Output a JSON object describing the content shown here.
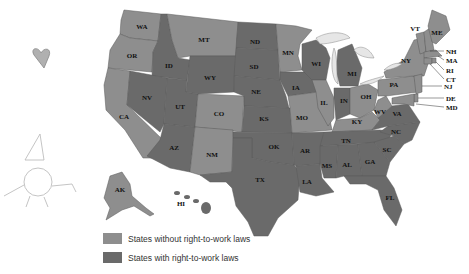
{
  "colors": {
    "without_rtw": "#8e8e8e",
    "with_rtw": "#6a6a6a",
    "lakes": "#e6e6e6"
  },
  "legend": [
    {
      "label": "States without right-to-work laws",
      "category": "without"
    },
    {
      "label": "States with right-to-work laws",
      "category": "with"
    }
  ],
  "states": {
    "WA": "WA",
    "OR": "OR",
    "CA": "CA",
    "ID": "ID",
    "NV": "NV",
    "UT": "UT",
    "AZ": "AZ",
    "MT": "MT",
    "WY": "WY",
    "CO": "CO",
    "NM": "NM",
    "ND": "ND",
    "SD": "SD",
    "NE": "NE",
    "KS": "KS",
    "OK": "OK",
    "TX": "TX",
    "MN": "MN",
    "IA": "IA",
    "MO": "MO",
    "AR": "AR",
    "LA": "LA",
    "WI": "WI",
    "IL": "IL",
    "MI": "MI",
    "IN": "IN",
    "OH": "OH",
    "KY": "KY",
    "TN": "TN",
    "MS": "MS",
    "AL": "AL",
    "GA": "GA",
    "FL": "FL",
    "SC": "SC",
    "NC": "NC",
    "VA": "VA",
    "WV": "WV",
    "PA": "PA",
    "NY": "NY",
    "VT": "VT",
    "ME": "ME",
    "NH": "NH",
    "MA": "MA",
    "RI": "RI",
    "CT": "CT",
    "NJ": "NJ",
    "DE": "DE",
    "MD": "MD",
    "AK": "AK",
    "HI": "HI"
  },
  "decorations": [
    "heart-sketch",
    "cartoon-character-sketch"
  ]
}
